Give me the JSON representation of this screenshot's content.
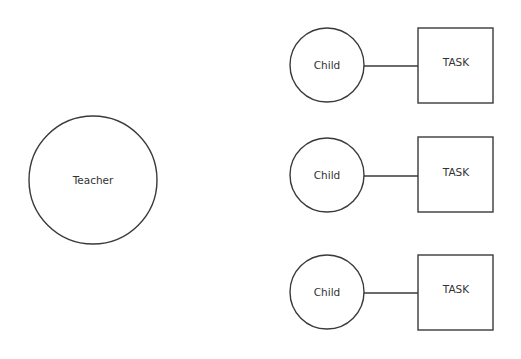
{
  "diagram": {
    "type": "relationship-diagram",
    "colors": {
      "stroke": "#3a3a3a",
      "text": "#333333",
      "background": "#ffffff"
    },
    "teacher": {
      "label": "Teacher",
      "shape": "circle",
      "cx": 93,
      "cy": 180,
      "r": 64
    },
    "pairs": [
      {
        "child": {
          "label": "Child",
          "shape": "circle",
          "cx": 327,
          "cy": 65,
          "r": 37
        },
        "task": {
          "label": "TASK",
          "shape": "square",
          "x": 418,
          "y": 28,
          "w": 75,
          "h": 75
        },
        "edge": {
          "x1": 364,
          "y1": 66,
          "x2": 418,
          "y2": 66
        }
      },
      {
        "child": {
          "label": "Child",
          "shape": "circle",
          "cx": 327,
          "cy": 175,
          "r": 37
        },
        "task": {
          "label": "TASK",
          "shape": "square",
          "x": 418,
          "y": 137,
          "w": 75,
          "h": 75
        },
        "edge": {
          "x1": 364,
          "y1": 176,
          "x2": 418,
          "y2": 176
        }
      },
      {
        "child": {
          "label": "Child",
          "shape": "circle",
          "cx": 327,
          "cy": 292,
          "r": 37
        },
        "task": {
          "label": "TASK",
          "shape": "square",
          "x": 418,
          "y": 255,
          "w": 75,
          "h": 75
        },
        "edge": {
          "x1": 364,
          "y1": 293,
          "x2": 418,
          "y2": 293
        }
      }
    ]
  }
}
